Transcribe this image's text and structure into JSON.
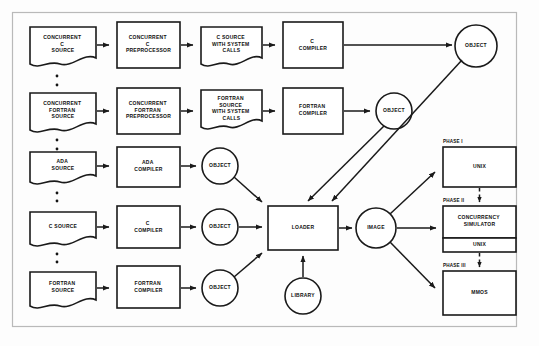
{
  "diagram": {
    "nodes": {
      "concurrent_c_source": "CONCURRENT\nC\nSOURCE",
      "concurrent_c_preprocessor": "CONCURRENT\nC\nPREPROCESSOR",
      "c_source_with_system_calls": "C SOURCE\nWITH SYSTEM\nCALLS",
      "c_compiler_top": "C\nCOMPILER",
      "object_top": "OBJECT",
      "concurrent_fortran_source": "CONCURRENT\nFORTRAN\nSOURCE",
      "concurrent_fortran_preprocessor": "CONCURRENT\nFORTRAN\nPREPROCESSOR",
      "fortran_source_with_system_calls": "FORTRAN\nSOURCE\nWITH SYSTEM\nCALLS",
      "fortran_compiler_top": "FORTRAN\nCOMPILER",
      "object_fortran_top": "OBJECT",
      "ada_source": "ADA\nSOURCE",
      "ada_compiler": "ADA\nCOMPILER",
      "object_ada": "OBJECT",
      "c_source": "C SOURCE",
      "c_compiler": "C\nCOMPILER",
      "object_c": "OBJECT",
      "fortran_source": "FORTRAN\nSOURCE",
      "fortran_compiler": "FORTRAN\nCOMPILER",
      "object_fortran": "OBJECT",
      "loader": "LOADER",
      "library": "LIBRARY",
      "image": "IMAGE",
      "unix_phase1": "UNIX",
      "concurrency_simulator": "CONCURRENCY\nSIMULATOR",
      "unix_phase2": "UNIX",
      "mmos": "MMOS"
    },
    "phase_labels": {
      "phase1": "PHASE I",
      "phase2": "PHASE II",
      "phase3": "PHASE III"
    },
    "ellipses": {
      "between_row1_row2": "⋮",
      "between_row2_row3": "⋮",
      "between_row3_row4": "⋮",
      "between_row4_row5": "⋮"
    },
    "colors": {
      "stroke": "#1a1a1a",
      "fill": "#ffffff",
      "frame": "#b9b9b9",
      "background": "#fdfdfd"
    }
  }
}
